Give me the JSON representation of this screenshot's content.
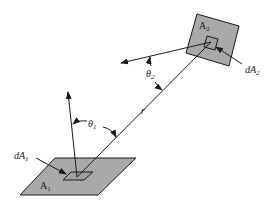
{
  "diagram": {
    "type": "view-factor-geometry",
    "colors": {
      "surface": "#a9a9a9",
      "stroke": "#1a1a1a",
      "background": "#ffffff"
    },
    "surfaces": [
      {
        "id": "A1",
        "label": "A",
        "sub": "1",
        "element_label": "dA",
        "element_sub": "1"
      },
      {
        "id": "A2",
        "label": "A",
        "sub": "2",
        "element_label": "dA",
        "element_sub": "2"
      }
    ],
    "angles": [
      {
        "label": "θ",
        "sub": "1"
      },
      {
        "label": "θ",
        "sub": "2"
      }
    ],
    "distance": {
      "label": "r"
    }
  }
}
